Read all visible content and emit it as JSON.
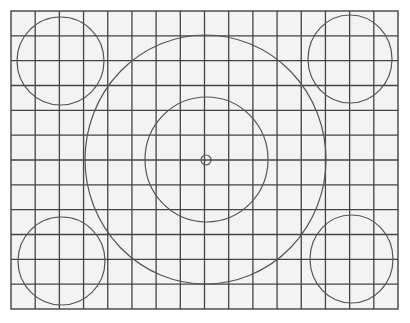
{
  "pattern": {
    "name": "test-chart-grid",
    "colors": {
      "page_background": "#ffffff",
      "grid_background": "#f3f3f3",
      "line": "#444444",
      "circle": "#555555"
    },
    "grid": {
      "x0": 11,
      "y0": 11,
      "x1": 398,
      "y1": 309,
      "columns": 16,
      "rows": 12
    },
    "circles": [
      {
        "id": "center-dot",
        "cx": 206,
        "cy": 160,
        "rx": 5,
        "ry": 5
      },
      {
        "id": "inner-circle",
        "cx": 206.5,
        "cy": 159.5,
        "rx": 61.5,
        "ry": 62.5
      },
      {
        "id": "outer-circle",
        "cx": 205.5,
        "cy": 159.5,
        "rx": 120.5,
        "ry": 124.5
      },
      {
        "id": "corner-circle-top-left",
        "cx": 60.5,
        "cy": 61,
        "rx": 43.5,
        "ry": 44
      },
      {
        "id": "corner-circle-top-right",
        "cx": 350,
        "cy": 59,
        "rx": 42,
        "ry": 44
      },
      {
        "id": "corner-circle-bottom-left",
        "cx": 61.5,
        "cy": 261,
        "rx": 43.5,
        "ry": 44
      },
      {
        "id": "corner-circle-bottom-right",
        "cx": 351.5,
        "cy": 259,
        "rx": 41.5,
        "ry": 44
      }
    ]
  }
}
